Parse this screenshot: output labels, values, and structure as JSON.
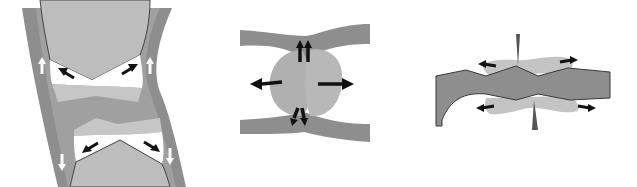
{
  "figure": {
    "panels": [
      {
        "id": "panel-1",
        "subject": "joint-with-two-bones",
        "arrows": {
          "black": 4,
          "white": 4
        }
      },
      {
        "id": "panel-2",
        "subject": "bulging-disc-between-layers",
        "arrows": {
          "black": 6
        }
      },
      {
        "id": "panel-3",
        "subject": "band-with-lateral-bulges",
        "arrows": {
          "black": 4
        }
      }
    ]
  },
  "colors": {
    "background": "#ffffff",
    "dark_band": "#8e8e8e",
    "mid_gray": "#a9a9a9",
    "light_gray": "#c4c4c4",
    "bone": "#bdbdbd",
    "white_space": "#ffffff",
    "outline": "#3a3a3a",
    "arrow": "#111111"
  }
}
